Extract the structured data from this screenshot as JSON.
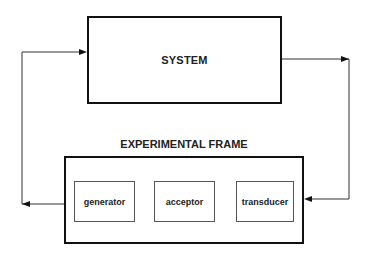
{
  "diagram": {
    "system": {
      "label": "SYSTEM"
    },
    "experimental_frame": {
      "title": "EXPERIMENTAL FRAME",
      "components": [
        {
          "label": "generator"
        },
        {
          "label": "acceptor"
        },
        {
          "label": "transducer"
        }
      ]
    },
    "connections": [
      {
        "from": "experimental_frame",
        "to": "system",
        "description": "generator output feeds system input"
      },
      {
        "from": "system",
        "to": "experimental_frame",
        "description": "system output feeds transducer"
      }
    ],
    "colors": {
      "stroke": "#111111",
      "text": "#222222",
      "background": "#ffffff"
    }
  }
}
